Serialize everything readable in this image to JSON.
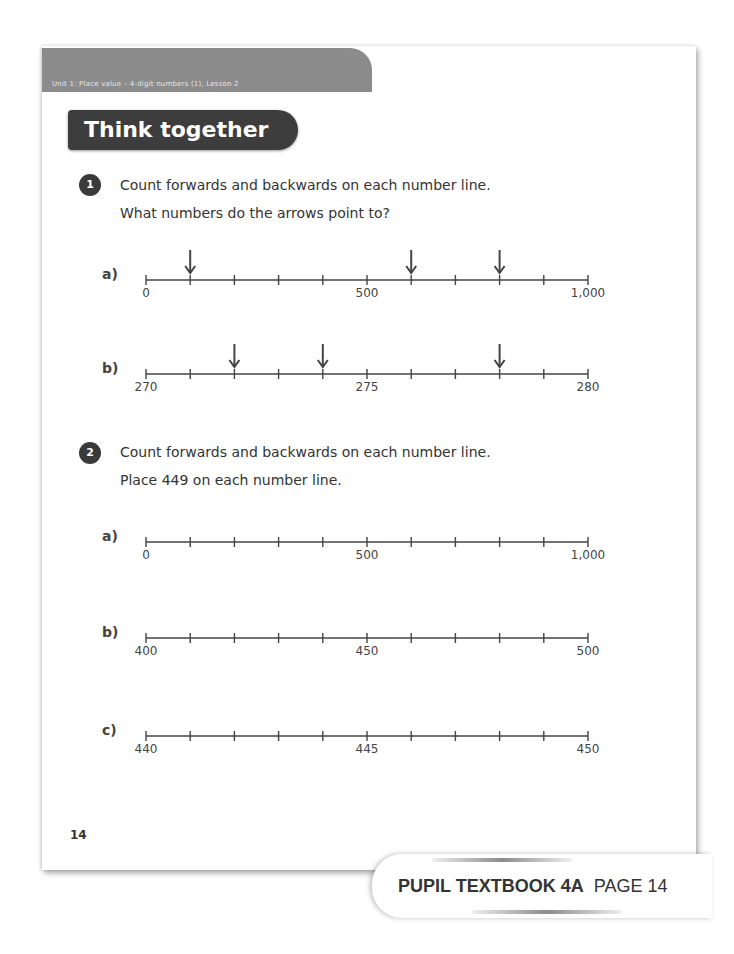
{
  "header": {
    "unit_banner": "Unit 1: Place value – 4-digit numbers (1), Lesson 2",
    "section_title": "Think together"
  },
  "questions": [
    {
      "number": "1",
      "line1": "Count forwards and backwards on each number line.",
      "line2": "What numbers do the arrows point to?",
      "parts": [
        {
          "label": "a)",
          "start": 0,
          "end": 1000,
          "intervals": 10,
          "tick_labels": [
            {
              "pos": 0,
              "text": "0"
            },
            {
              "pos": 5,
              "text": "500"
            },
            {
              "pos": 10,
              "text": "1,000"
            }
          ],
          "arrows_at_ticks": [
            1,
            6,
            8
          ]
        },
        {
          "label": "b)",
          "start": 270,
          "end": 280,
          "intervals": 10,
          "tick_labels": [
            {
              "pos": 0,
              "text": "270"
            },
            {
              "pos": 5,
              "text": "275"
            },
            {
              "pos": 10,
              "text": "280"
            }
          ],
          "arrows_at_ticks": [
            2,
            4,
            8
          ]
        }
      ]
    },
    {
      "number": "2",
      "line1": "Count forwards and backwards on each number line.",
      "line2": "Place 449 on each number line.",
      "parts": [
        {
          "label": "a)",
          "start": 0,
          "end": 1000,
          "intervals": 10,
          "tick_labels": [
            {
              "pos": 0,
              "text": "0"
            },
            {
              "pos": 5,
              "text": "500"
            },
            {
              "pos": 10,
              "text": "1,000"
            }
          ],
          "arrows_at_ticks": []
        },
        {
          "label": "b)",
          "start": 400,
          "end": 500,
          "intervals": 10,
          "tick_labels": [
            {
              "pos": 0,
              "text": "400"
            },
            {
              "pos": 5,
              "text": "450"
            },
            {
              "pos": 10,
              "text": "500"
            }
          ],
          "arrows_at_ticks": []
        },
        {
          "label": "c)",
          "start": 440,
          "end": 450,
          "intervals": 10,
          "tick_labels": [
            {
              "pos": 0,
              "text": "440"
            },
            {
              "pos": 5,
              "text": "445"
            },
            {
              "pos": 10,
              "text": "450"
            }
          ],
          "arrows_at_ticks": []
        }
      ]
    }
  ],
  "page_number": "14",
  "footer": {
    "book": "PUPIL TEXTBOOK 4A",
    "page": "PAGE 14"
  },
  "colors": {
    "banner": "#8c8c8c",
    "title_bg": "#3d3d3d",
    "line": "#444444"
  }
}
